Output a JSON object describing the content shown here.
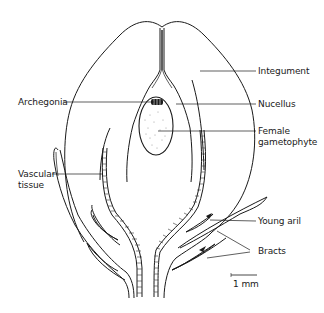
{
  "figure": {
    "labels": {
      "integument": "Integument",
      "archegonia": "Archegonia",
      "nucellus": "Nucellus",
      "female_gametophyte_1": "Female",
      "female_gametophyte_2": "gametophyte",
      "vascular_tissue_1": "Vascular",
      "vascular_tissue_2": "tissue",
      "young_aril": "Young aril",
      "bracts": "Bracts"
    },
    "scale_bar": {
      "label": "1 mm"
    },
    "colors": {
      "line": "#1a1a1a",
      "background": "#ffffff"
    }
  }
}
